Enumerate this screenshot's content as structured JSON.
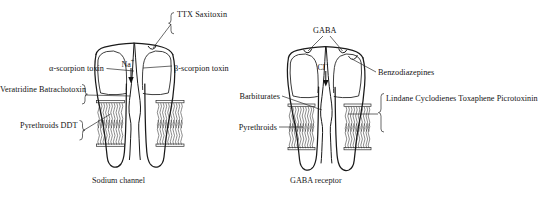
{
  "figure": {
    "background_color": "#ffffff",
    "line_color": "#1a1a1a",
    "text_color": "#121212"
  },
  "panels": [
    {
      "id": "sodium-channel",
      "caption": "Sodium channel",
      "ion": {
        "label": "Na",
        "charge": "+",
        "flow": "inward",
        "arrow": "↓"
      },
      "labels": [
        {
          "id": "ttx",
          "lines": [
            "TTX",
            "Saxitoxin"
          ],
          "brace": true,
          "brace_side": "left",
          "side": "right",
          "target": "outer-pore-notch"
        },
        {
          "id": "alpha-scorpion-toxin",
          "lines": [
            "α-scorpion toxin"
          ],
          "brace": false,
          "side": "left",
          "target": "left-subunit-outer"
        },
        {
          "id": "beta-scorpion-toxin",
          "lines": [
            "β-scorpion toxin"
          ],
          "brace": false,
          "side": "right",
          "target": "right-subunit-outer"
        },
        {
          "id": "veratridine-batrachotoxin",
          "lines": [
            "Veratridine",
            "Batrachotoxin"
          ],
          "brace": true,
          "brace_side": "right",
          "side": "left",
          "target": "left-subunit-mid"
        },
        {
          "id": "pyrethroids-ddt",
          "lines": [
            "Pyrethroids",
            "DDT"
          ],
          "brace": true,
          "brace_side": "right",
          "side": "left",
          "target": "membrane-left-inner"
        }
      ]
    },
    {
      "id": "gaba-receptor",
      "caption": "GABA receptor",
      "ion": {
        "label": "Cl",
        "charge": "−",
        "flow": "inward",
        "arrow": "↓"
      },
      "labels": [
        {
          "id": "gaba",
          "lines": [
            "GABA"
          ],
          "brace": false,
          "side": "top",
          "target": "two-binding-notches",
          "leader_count": 2
        },
        {
          "id": "benzodiazepines",
          "lines": [
            "Benzodiazepines"
          ],
          "brace": false,
          "side": "right",
          "target": "right-subunit-outer"
        },
        {
          "id": "barbiturates",
          "lines": [
            "Barbiturates"
          ],
          "brace": false,
          "side": "left",
          "target": "channel-pore-upper"
        },
        {
          "id": "pyrethroids",
          "lines": [
            "Pyrethroids"
          ],
          "brace": false,
          "side": "left",
          "target": "membrane-left-inner"
        },
        {
          "id": "lindane-group",
          "lines": [
            "Lindane",
            "Cyclodienes",
            "Toxaphene",
            "Picrotoxinin"
          ],
          "brace": true,
          "brace_side": "left",
          "side": "right",
          "target": "membrane-right-inner"
        }
      ]
    }
  ]
}
